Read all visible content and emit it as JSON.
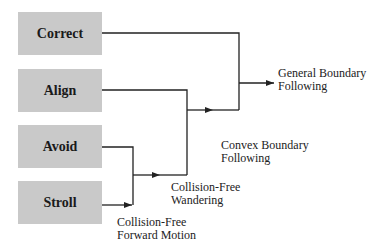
{
  "behaviors": [
    {
      "id": "correct",
      "label": "Correct"
    },
    {
      "id": "align",
      "label": "Align"
    },
    {
      "id": "avoid",
      "label": "Avoid"
    },
    {
      "id": "stroll",
      "label": "Stroll"
    }
  ],
  "outputs": [
    {
      "id": "forward",
      "line1": "Collision-Free",
      "line2": "Forward Motion"
    },
    {
      "id": "wandering",
      "line1": "Collision-Free",
      "line2": "Wandering"
    },
    {
      "id": "convex",
      "line1": "Convex Boundary",
      "line2": "Following"
    },
    {
      "id": "general",
      "line1": "General Boundary",
      "line2": "Following"
    }
  ],
  "colors": {
    "box": "#c9c9c9",
    "line": "#222222"
  }
}
